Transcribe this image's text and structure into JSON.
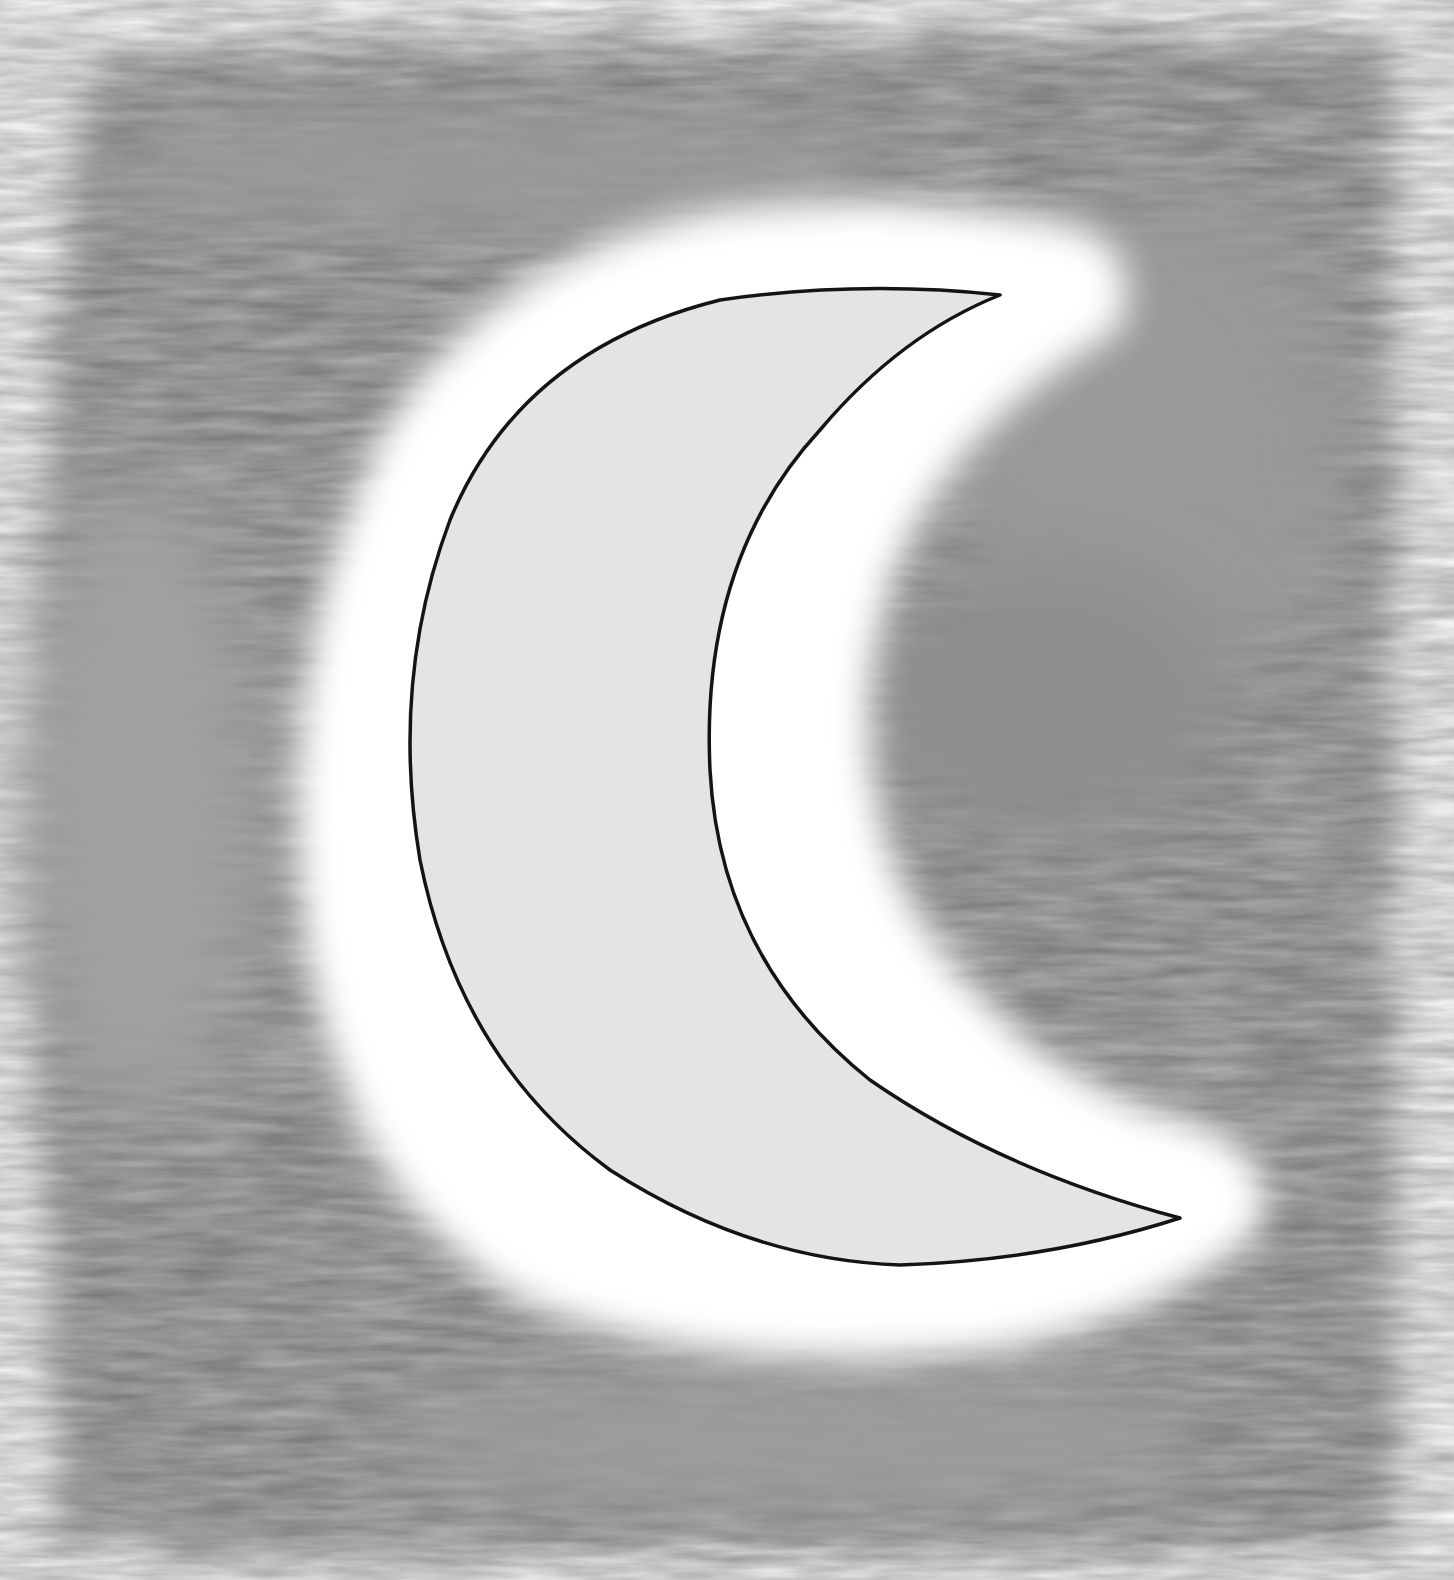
{
  "image": {
    "description": "Watercolor illustration of a crescent moon on a gray wash sky",
    "subject": "crescent moon",
    "colors": {
      "paper": "#ffffff",
      "wash_light": "#c4c4c4",
      "wash_mid": "#a9a9a9",
      "wash_dark": "#8f8f8f",
      "moon_fill": "#e4e4e4",
      "outline": "#141414"
    }
  }
}
